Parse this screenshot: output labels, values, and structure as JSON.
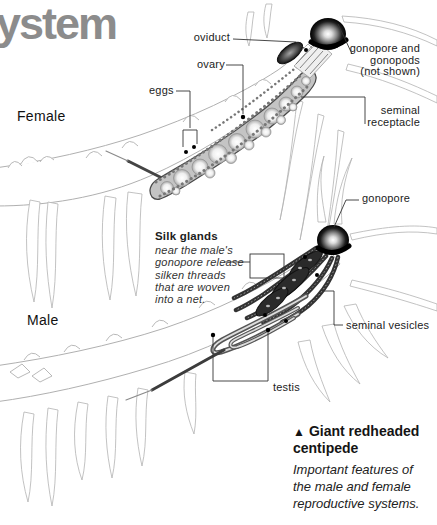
{
  "heading": {
    "text": "ystem"
  },
  "palette": {
    "heading_gray": "#8c8c8c",
    "label_text": "#1c1c1c",
    "line_art_gray": "#b0b0b0",
    "organ_dark": "#2b2b2b",
    "leader_line": "#333333"
  },
  "female": {
    "section_label": "Female",
    "labels": {
      "oviduct": "oviduct",
      "ovary": "ovary",
      "eggs": "eggs",
      "gonopore": [
        "gonopore and",
        "gonopods"
      ],
      "gonopore_note": "(not shown)",
      "seminal_receptacle": [
        "seminal",
        "receptacle"
      ]
    }
  },
  "male": {
    "section_label": "Male",
    "labels": {
      "gonopore": "gonopore",
      "silk_glands_title": "Silk glands",
      "silk_glands_note": [
        "near the male's",
        "gonopore release",
        "silken threads",
        "that are woven",
        "into a net."
      ],
      "seminal_vesicles": "seminal vesicles",
      "testis": "testis"
    }
  },
  "caption": {
    "marker": "▲",
    "title": [
      "Giant redheaded",
      "centipede"
    ],
    "note": [
      "Important features of",
      "the male and female",
      "reproductive systems."
    ]
  }
}
